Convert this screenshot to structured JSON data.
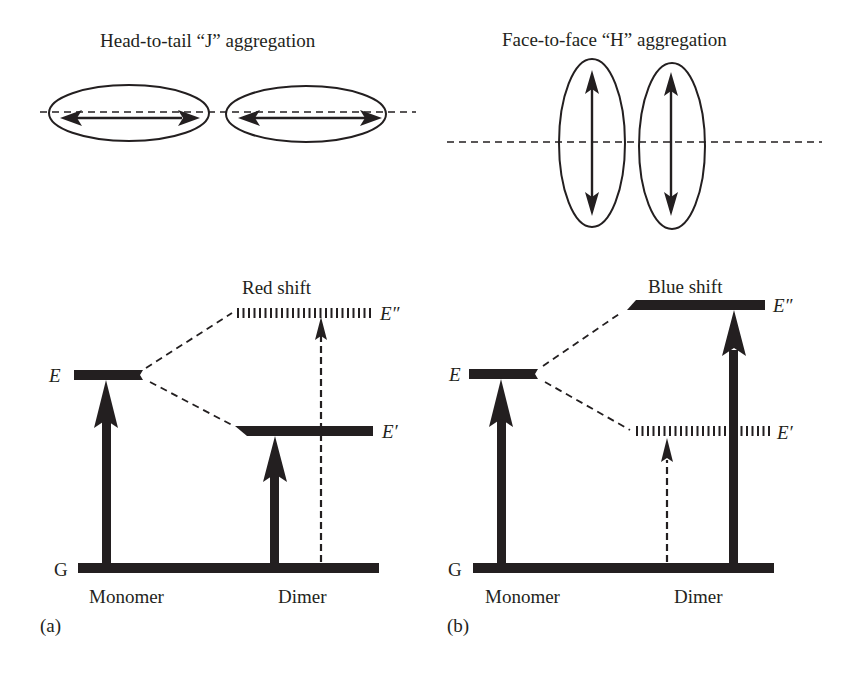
{
  "figure": {
    "panel_a": {
      "panel_label": "(a)",
      "title": "Head-to-tail “J” aggregation",
      "shift_label": "Red shift",
      "levels": {
        "E": "E",
        "E_prime": "E′",
        "E_double_prime": "E″",
        "G": "G"
      },
      "x_labels": {
        "monomer": "Monomer",
        "dimer": "Dimer"
      },
      "allowed_transition": "G → E′ (solid arrow)",
      "forbidden_transition": "G → E″ (dashed arrow)"
    },
    "panel_b": {
      "panel_label": "(b)",
      "title": "Face-to-face “H” aggregation",
      "shift_label": "Blue shift",
      "levels": {
        "E": "E",
        "E_prime": "E′",
        "E_double_prime": "E″",
        "G": "G"
      },
      "x_labels": {
        "monomer": "Monomer",
        "dimer": "Dimer"
      },
      "allowed_transition": "G → E″ (solid arrow)",
      "forbidden_transition": "G → E′ (dashed arrow)"
    },
    "colors": {
      "ink": "#231f20",
      "background": "#ffffff"
    }
  }
}
